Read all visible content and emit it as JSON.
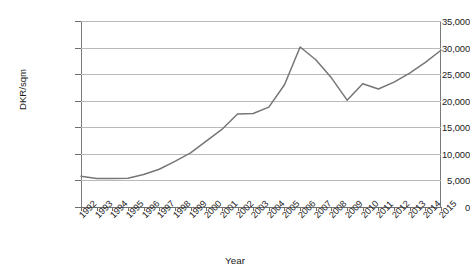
{
  "chart_data": {
    "type": "line",
    "title": "",
    "xlabel": "Year",
    "ylabel": "DKR/sqm",
    "grid": true,
    "legend": "none",
    "xlim": [
      1992,
      2015
    ],
    "ylim": [
      0,
      35000
    ],
    "ytick_labels": [
      "35,000",
      "30,000",
      "25,000",
      "20,000",
      "15,000",
      "10,000",
      "5,000",
      "0"
    ],
    "ytick_values": [
      35000,
      30000,
      25000,
      20000,
      15000,
      10000,
      5000,
      0
    ],
    "categories": [
      "1992",
      "1993",
      "1994",
      "1995",
      "1996",
      "1997",
      "1998",
      "1999",
      "2000",
      "2001",
      "2002",
      "2003",
      "2004",
      "2005",
      "2006",
      "2007",
      "2008",
      "2009",
      "2010",
      "2011",
      "2012",
      "2013",
      "2014",
      "2015"
    ],
    "series": [
      {
        "name": "DKR/sqm",
        "color": "#767676",
        "values": [
          5800,
          5350,
          5350,
          5400,
          6100,
          7100,
          8600,
          10200,
          12400,
          14600,
          17500,
          17600,
          18800,
          23000,
          30100,
          27700,
          24300,
          20100,
          23200,
          22200,
          23500,
          25200,
          27200,
          29500
        ]
      }
    ]
  },
  "axis": {
    "x_title": "Year",
    "y_title": "DKR/sqm"
  }
}
